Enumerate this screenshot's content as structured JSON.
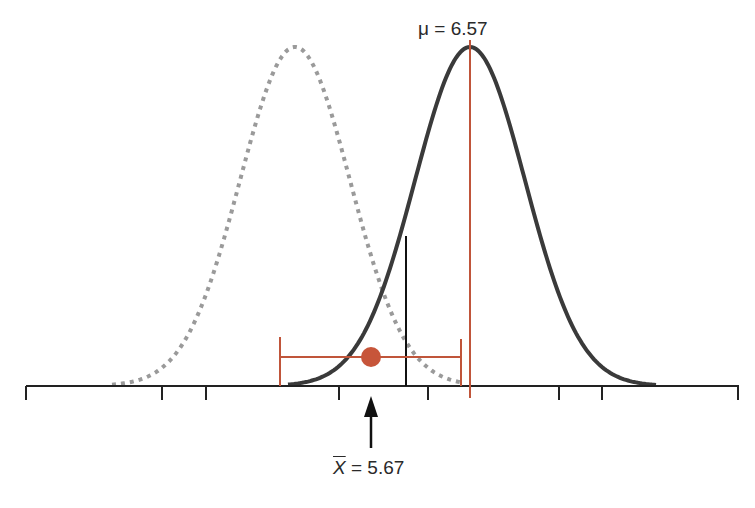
{
  "diagram": {
    "title": "",
    "mu_label": {
      "symbol": "μ",
      "equals": "=",
      "value": "6.57"
    },
    "xbar_label": {
      "symbol": "X",
      "equals": "=",
      "value": "5.67"
    },
    "colors": {
      "solid_curve": "#3a3a3a",
      "dotted_curve": "#9a9a9a",
      "accent_red": "#c0553a",
      "axis": "#222222"
    },
    "axis": {
      "y": 386,
      "x_start": 26,
      "x_end": 738,
      "tick_positions_px": [
        26,
        162,
        206,
        339,
        428,
        559,
        602,
        738
      ]
    },
    "curves": [
      {
        "name": "null-distribution",
        "style": "dotted",
        "center_px": 295,
        "peak_y_px": 47
      },
      {
        "name": "true-distribution",
        "style": "solid",
        "center_px": 470,
        "peak_y_px": 47,
        "mean": 6.57
      }
    ],
    "confidence_interval": {
      "left_px": 280,
      "right_px": 461,
      "point_px": 371,
      "y_px": 357,
      "sample_mean": 5.67
    },
    "critical_line_px": 406
  }
}
